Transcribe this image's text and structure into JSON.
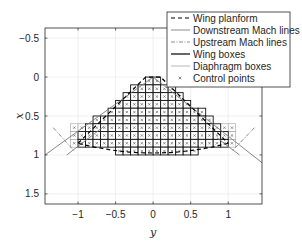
{
  "chart_data": {
    "type": "line",
    "title": "",
    "xlabel": "y",
    "ylabel": "x",
    "xlim": [
      -1.44,
      1.45
    ],
    "ylim": [
      -0.63,
      1.63
    ],
    "y_axis_reversed": true,
    "grid": true,
    "x_ticks": [
      -1,
      -0.5,
      0,
      0.5,
      1
    ],
    "x_tick_labels": [
      "−1",
      "−0.5",
      "0",
      "0.5",
      "1"
    ],
    "y_ticks": [
      -0.5,
      0,
      0.5,
      1,
      1.5
    ],
    "y_tick_labels": [
      "−0.5",
      "0",
      "0.5",
      "1",
      "1.5"
    ],
    "legend_position": "northeast-outside-top",
    "legend": [
      {
        "label": "Wing planform",
        "style": "dashed",
        "color": "#000000"
      },
      {
        "label": "Downstream Mach lines",
        "style": "solid",
        "color": "#808080"
      },
      {
        "label": "Upstream Mach lines",
        "style": "dash-dot",
        "color": "#808080"
      },
      {
        "label": "Wing boxes",
        "style": "solid-thick",
        "color": "#000000"
      },
      {
        "label": "Diaphragm boxes",
        "style": "solid-thin",
        "color": "#999999"
      },
      {
        "label": "Control points",
        "style": "marker-x",
        "color": "#555555"
      }
    ],
    "series": [
      {
        "name": "Wing planform",
        "points_yx": [
          [
            -1.0,
            0.85
          ],
          [
            -0.1,
            0.0
          ],
          [
            0.1,
            0.0
          ],
          [
            1.0,
            0.85
          ],
          [
            0.5,
            0.97
          ],
          [
            0.0,
            1.0
          ],
          [
            -0.5,
            0.97
          ],
          [
            -1.0,
            0.85
          ]
        ]
      },
      {
        "name": "Downstream Mach lines",
        "segments_yx": [
          [
            [
              -1.44,
              1.0
            ],
            [
              0.0,
              0.0
            ]
          ],
          [
            [
              1.45,
              1.1
            ],
            [
              0.0,
              0.0
            ]
          ],
          [
            [
              -1.15,
              1.0
            ],
            [
              -0.65,
              0.63
            ]
          ],
          [
            [
              1.15,
              1.0
            ],
            [
              0.85,
              0.78
            ]
          ]
        ]
      },
      {
        "name": "Upstream Mach lines",
        "segments_yx": [
          [
            [
              -1.33,
              0.65
            ],
            [
              -1.05,
              0.95
            ]
          ],
          [
            [
              1.35,
              0.65
            ],
            [
              1.05,
              0.95
            ]
          ]
        ]
      }
    ],
    "wing_boxes": {
      "box_size": 0.1,
      "rows": [
        {
          "x_top": 0.0,
          "y_from": -0.1,
          "y_to": 0.1
        },
        {
          "x_top": 0.1,
          "y_from": -0.3,
          "y_to": 0.3
        },
        {
          "x_top": 0.2,
          "y_from": -0.4,
          "y_to": 0.4
        },
        {
          "x_top": 0.3,
          "y_from": -0.5,
          "y_to": 0.5
        },
        {
          "x_top": 0.4,
          "y_from": -0.6,
          "y_to": 0.7
        },
        {
          "x_top": 0.5,
          "y_from": -0.8,
          "y_to": 0.8
        },
        {
          "x_top": 0.6,
          "y_from": -0.9,
          "y_to": 0.9
        },
        {
          "x_top": 0.7,
          "y_from": -1.0,
          "y_to": 1.0
        },
        {
          "x_top": 0.8,
          "y_from": -1.0,
          "y_to": 1.0
        },
        {
          "x_top": 0.9,
          "y_from": -0.5,
          "y_to": 0.6
        }
      ]
    },
    "diaphragm_boxes": {
      "rows": [
        {
          "x_top": 0.6,
          "y_from": -1.1,
          "y_to": -0.9
        },
        {
          "x_top": 0.7,
          "y_from": -1.1,
          "y_to": -1.0
        },
        {
          "x_top": 0.8,
          "y_from": -1.1,
          "y_to": -1.0
        },
        {
          "x_top": 0.6,
          "y_from": 0.9,
          "y_to": 1.1
        },
        {
          "x_top": 0.7,
          "y_from": 1.0,
          "y_to": 1.1
        },
        {
          "x_top": 0.8,
          "y_from": 1.0,
          "y_to": 1.1
        }
      ]
    }
  }
}
